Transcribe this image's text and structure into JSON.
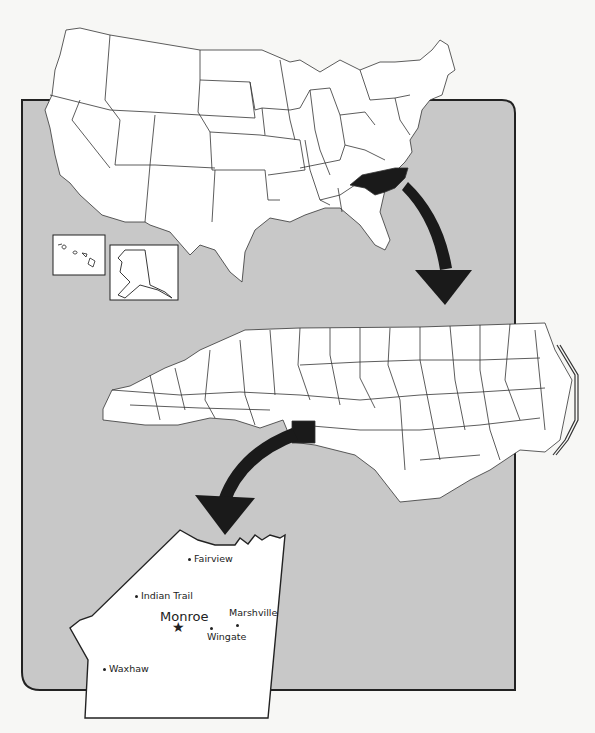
{
  "colors": {
    "panel": "#c8c8c8",
    "land": "#ffffff",
    "highlight": "#1a1a1a",
    "border": "#222222",
    "background": "#f7f7f5"
  },
  "maps": {
    "usa": {
      "label": "United States",
      "highlighted_state": "North Carolina",
      "insets": [
        "Hawaii",
        "Alaska"
      ]
    },
    "nc": {
      "label": "North Carolina",
      "highlighted_county": "Union County"
    },
    "county": {
      "label": "Union County",
      "places": [
        {
          "name": "Fairview",
          "type": "town"
        },
        {
          "name": "Indian Trail",
          "type": "town"
        },
        {
          "name": "Monroe",
          "type": "county-seat",
          "marker": "star"
        },
        {
          "name": "Marshville",
          "type": "town"
        },
        {
          "name": "Wingate",
          "type": "town"
        },
        {
          "name": "Waxhaw",
          "type": "town"
        }
      ]
    }
  },
  "star": "★"
}
